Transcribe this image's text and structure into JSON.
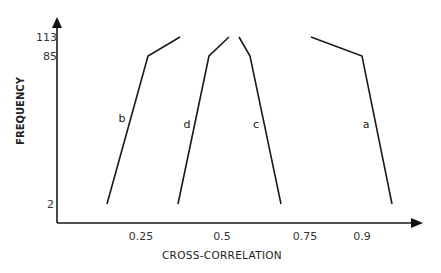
{
  "chart_data": {
    "type": "line",
    "title": "",
    "xlabel": "CROSS-CORRELATION",
    "ylabel": "FREQUENCY",
    "x_ticks": [
      "0.25",
      "0.5",
      "0.75",
      "0.9"
    ],
    "x_tick_values": [
      0.25,
      0.5,
      0.75,
      0.9
    ],
    "y_ticks": [
      "2",
      "85",
      "113"
    ],
    "y_tick_values": [
      2,
      85,
      113
    ],
    "grid": false,
    "legend": "none (curves labeled inline)",
    "series": [
      {
        "name": "b",
        "points": [
          [
            0.15,
            2
          ],
          [
            0.27,
            85
          ],
          [
            0.37,
            113
          ]
        ]
      },
      {
        "name": "d",
        "points": [
          [
            0.36,
            2
          ],
          [
            0.46,
            85
          ],
          [
            0.52,
            113
          ]
        ]
      },
      {
        "name": "c",
        "points": [
          [
            0.55,
            113
          ],
          [
            0.59,
            85
          ],
          [
            0.68,
            2
          ]
        ]
      },
      {
        "name": "a",
        "points": [
          [
            0.77,
            113
          ],
          [
            0.9,
            85
          ],
          [
            0.98,
            2
          ]
        ]
      }
    ]
  },
  "axes": {
    "x_title": "CROSS-CORRELATION",
    "y_title": "FREQUENCY",
    "x_ticks": [
      {
        "label": "0.25",
        "px": 141
      },
      {
        "label": "0.5",
        "px": 222
      },
      {
        "label": "0.75",
        "px": 305
      },
      {
        "label": "0.9",
        "px": 362
      }
    ],
    "y_ticks": [
      {
        "label": "113",
        "py": 37
      },
      {
        "label": "85",
        "py": 56
      },
      {
        "label": "2",
        "py": 204
      }
    ]
  },
  "curves": [
    {
      "label": "b",
      "path_px": [
        [
          107,
          204
        ],
        [
          148,
          56
        ],
        [
          180,
          37
        ]
      ],
      "label_px": [
        122,
        122
      ]
    },
    {
      "label": "d",
      "path_px": [
        [
          178,
          204
        ],
        [
          209,
          56
        ],
        [
          229,
          37
        ]
      ],
      "label_px": [
        187,
        128
      ]
    },
    {
      "label": "c",
      "path_px": [
        [
          239,
          37
        ],
        [
          250,
          56
        ],
        [
          281,
          204
        ]
      ],
      "label_px": [
        256,
        128
      ]
    },
    {
      "label": "a",
      "path_px": [
        [
          311,
          37
        ],
        [
          362,
          56
        ],
        [
          392,
          204
        ]
      ],
      "label_px": [
        366,
        128
      ]
    }
  ],
  "colors": {
    "line": "#1a1a1a",
    "background": "#ffffff",
    "text": "#333333"
  }
}
